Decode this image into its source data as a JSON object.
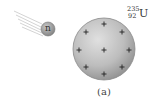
{
  "diagram": {
    "caption": "(a)",
    "neutron": {
      "label": "n",
      "center": [
        48,
        29
      ],
      "radius": 7,
      "fill": "#9a9a9a"
    },
    "nucleus": {
      "isotope_mass_number": "235",
      "isotope_atomic_number": "92",
      "isotope_symbol": "U",
      "center": [
        104,
        49
      ],
      "radius": 31,
      "fill": "#b8b8b8",
      "charge_symbol": "+",
      "charge_count": 9
    },
    "colors": {
      "background": "#ffffff",
      "outline": "#888888",
      "text": "#333333"
    }
  }
}
